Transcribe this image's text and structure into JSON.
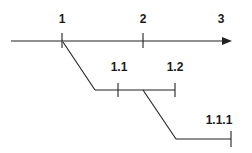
{
  "diagram": {
    "type": "branching-timeline",
    "main_axis": {
      "labels": [
        "1",
        "2",
        "3"
      ]
    },
    "branch_1": {
      "parent": "1",
      "labels": [
        "1.1",
        "1.2"
      ]
    },
    "branch_2": {
      "parent": "1.1",
      "labels": [
        "1.1.1"
      ]
    },
    "colors": {
      "line": "#222222",
      "text": "#1a1a1a",
      "background": "#ffffff"
    }
  }
}
